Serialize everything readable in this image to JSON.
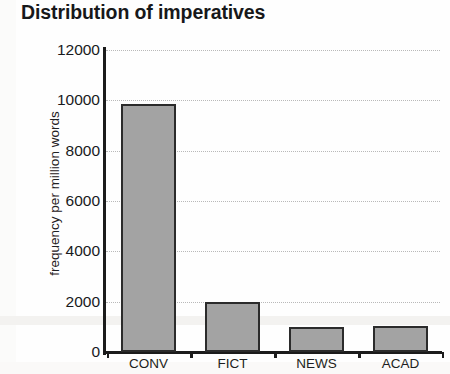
{
  "chart_data": {
    "type": "bar",
    "title": "Distribution of imperatives",
    "xlabel": "",
    "ylabel": "frequency per million words",
    "categories": [
      "CONV",
      "FICT",
      "NEWS",
      "ACAD"
    ],
    "values": [
      9850,
      1980,
      1000,
      1040
    ],
    "ylim": [
      0,
      12000
    ],
    "ytick_labels": [
      "0",
      "2000",
      "4000",
      "6000",
      "8000",
      "10000",
      "12000"
    ],
    "ytick_values": [
      0,
      2000,
      4000,
      6000,
      8000,
      10000,
      12000
    ],
    "grid": true,
    "grid_axis": "y",
    "grid_style": "dotted",
    "legend": false,
    "legend_position": "none",
    "bar_fill_color": "#a3a3a3",
    "bar_edge_color": "#2b2b2b",
    "background_color": "#fefefe",
    "axis_color": "#1b1b1b"
  }
}
